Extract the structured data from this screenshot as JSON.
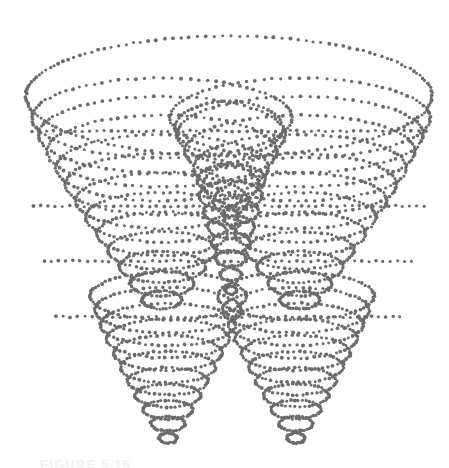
{
  "page": {
    "background_color": "#ffffff",
    "width": 449,
    "height": 468,
    "type": "scanned-figure"
  },
  "figure": {
    "name": "dotted-hyperboloid-funnel-plot",
    "dot_color": "#6b6b6b",
    "dot_radius": 1.7,
    "bounds": {
      "left": 25,
      "top": 36,
      "right": 432,
      "bottom": 442
    }
  },
  "caption": {
    "text": "FIGURE 5.15",
    "visible": "partially-cropped"
  },
  "chart_data": {
    "type": "scatter",
    "title": "",
    "subtitle": "",
    "xlabel": "",
    "ylabel": "",
    "grid": false,
    "legend": null,
    "axis_visible": false,
    "render_style": "stippled-dot-contours",
    "point_color": "#6b6b6b",
    "point_size": 3.4,
    "xlim": [
      0,
      449
    ],
    "ylim": [
      0,
      468
    ],
    "projection": {
      "center_x": 229,
      "perspective_tilt": 0.3,
      "note": "Ellipses drawn with constant vertical squash factor simulating a 3D oblique view"
    },
    "annotations": [],
    "series": [
      {
        "name": "outer-rim-ellipse",
        "kind": "ellipse-ring",
        "cx": 229,
        "cy": 96,
        "rx": 203,
        "ry": 60,
        "n_points": 150,
        "values": []
      },
      {
        "name": "upper-funnel-contours-left",
        "kind": "ellipse-ring-stack",
        "cx": 162,
        "cy_start": 118,
        "cy_end": 300,
        "rx_start": 130,
        "rx_end": 20,
        "ry_start": 40,
        "ry_end": 9,
        "rings": 12,
        "n_points_per_ring": 90,
        "values": []
      },
      {
        "name": "upper-funnel-contours-right",
        "kind": "ellipse-ring-stack",
        "cx": 300,
        "cy_start": 118,
        "cy_end": 300,
        "rx_start": 130,
        "rx_end": 20,
        "ry_start": 40,
        "ry_end": 9,
        "rings": 12,
        "n_points_per_ring": 90,
        "values": []
      },
      {
        "name": "inner-small-ellipse",
        "kind": "ellipse-ring",
        "cx": 229,
        "cy": 128,
        "rx": 54,
        "ry": 27,
        "n_points": 56,
        "values": []
      },
      {
        "name": "lower-funnel-left",
        "kind": "cone-ring-stack",
        "cx": 168,
        "cy_start": 296,
        "cy_end": 438,
        "rx_start": 78,
        "rx_end": 9,
        "ry_start": 24,
        "ry_end": 5,
        "rings": 11,
        "n_points_per_ring": 70,
        "values": []
      },
      {
        "name": "lower-funnel-right",
        "kind": "cone-ring-stack",
        "cx": 296,
        "cy_start": 296,
        "cy_end": 438,
        "rx_start": 78,
        "rx_end": 9,
        "ry_start": 24,
        "ry_end": 5,
        "rings": 11,
        "n_points_per_ring": 70,
        "values": []
      },
      {
        "name": "waist-convergence-ellipses",
        "kind": "ellipse-ring-stack",
        "cx": 231,
        "cy_start": 180,
        "cy_end": 290,
        "rx_start": 34,
        "rx_end": 6,
        "ry_start": 16,
        "ry_end": 4,
        "rings": 8,
        "n_points_per_ring": 44,
        "values": []
      },
      {
        "name": "horizontal-mid-chords",
        "kind": "chord-lines",
        "lines": [
          {
            "y": 131,
            "x1": 18,
            "x2": 440
          },
          {
            "y": 206,
            "x1": 12,
            "x2": 446
          },
          {
            "y": 261,
            "x1": 8,
            "x2": 448
          },
          {
            "y": 317,
            "x1": 20,
            "x2": 436
          }
        ],
        "values": []
      }
    ]
  }
}
